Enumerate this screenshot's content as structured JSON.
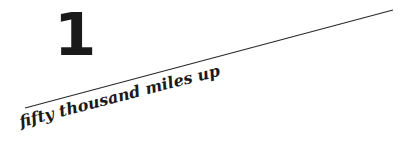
{
  "chapter": {
    "number": "1",
    "title": "fifty thousand miles up"
  },
  "colors": {
    "ink": "#1a1a1a",
    "background": "#ffffff"
  }
}
